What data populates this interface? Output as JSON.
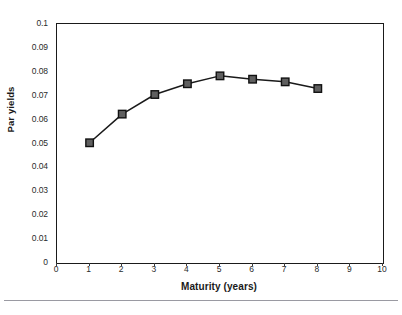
{
  "chart_data": {
    "type": "line",
    "title": "",
    "xlabel": "Maturity (years)",
    "ylabel": "Par yields",
    "x": [
      1,
      2,
      3,
      4,
      5,
      6,
      7,
      8
    ],
    "values": [
      0.0503,
      0.0623,
      0.0705,
      0.075,
      0.0783,
      0.0769,
      0.0758,
      0.073
    ],
    "series": [
      {
        "name": "Par yields",
        "x": [
          1,
          2,
          3,
          4,
          5,
          6,
          7,
          8
        ],
        "values": [
          0.0503,
          0.0623,
          0.0705,
          0.075,
          0.0783,
          0.0769,
          0.0758,
          0.073
        ]
      }
    ],
    "xlim": [
      0,
      10
    ],
    "ylim": [
      0,
      0.1
    ],
    "x_ticks": [
      0,
      1,
      2,
      3,
      4,
      5,
      6,
      7,
      8,
      9,
      10
    ],
    "x_tick_labels": [
      "0",
      "1",
      "2",
      "3",
      "4",
      "5",
      "6",
      "7",
      "8",
      "9",
      "10"
    ],
    "y_ticks": [
      0,
      0.01,
      0.02,
      0.03,
      0.04,
      0.05,
      0.06,
      0.07,
      0.08,
      0.09,
      0.1
    ],
    "y_tick_labels": [
      "0",
      "0.01",
      "0.02",
      "0.03",
      "0.04",
      "0.05",
      "0.06",
      "0.07",
      "0.08",
      "0.09",
      "0.1"
    ],
    "grid": false,
    "legend": false,
    "legend_position": "none",
    "marker": "square",
    "line_color": "#1a1a1a",
    "marker_fill_color": "#5f5f5f",
    "marker_edge_color": "#111111",
    "frame_color": "#1a1a1a",
    "background_color": "#ffffff"
  }
}
